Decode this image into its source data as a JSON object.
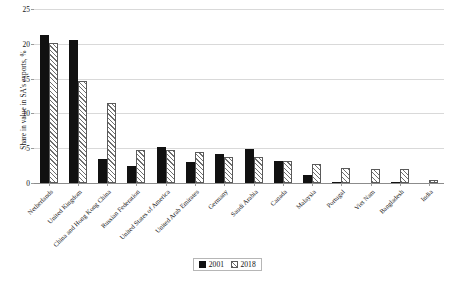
{
  "chart_data": {
    "type": "bar",
    "title": "",
    "xlabel": "",
    "ylabel": "Share in value in SA's exports, %",
    "ylim": [
      0,
      25
    ],
    "yticks": [
      0,
      5,
      10,
      15,
      20,
      25
    ],
    "grid": true,
    "legend_position": "bottom-center",
    "categories": [
      "Netherlands",
      "United Kingdom",
      "China and Hong Kong China",
      "Russian Federation",
      "United States of America",
      "United Arab Emirates",
      "Germany",
      "Saudi Arabia",
      "Canada",
      "Malaysia",
      "Portugal",
      "Viet Nam",
      "Bangladesh",
      "India"
    ],
    "series": [
      {
        "name": "2001",
        "values": [
          21.3,
          20.6,
          3.4,
          2.5,
          5.2,
          3.0,
          4.1,
          4.9,
          3.2,
          1.2,
          0.1,
          0.0,
          0.15,
          0.0
        ]
      },
      {
        "name": "2018",
        "values": [
          20.1,
          14.6,
          11.5,
          4.8,
          4.8,
          4.5,
          3.8,
          3.7,
          3.2,
          2.8,
          2.1,
          2.0,
          2.0,
          0.5
        ]
      }
    ]
  },
  "legend": {
    "items": [
      {
        "label": "2001",
        "pattern": "solid",
        "color": "#111111"
      },
      {
        "label": "2018",
        "pattern": "diagonal-hatch",
        "color": "#6e6e6e"
      }
    ]
  },
  "axis": {
    "y_title": "Share in value in SA's exports, %",
    "y_tick_labels": [
      "0",
      "5",
      "10",
      "15",
      "20",
      "25"
    ]
  },
  "colors": {
    "series_2001": "#111111",
    "series_2018_hatch": "#6e6e6e",
    "gridline": "#d9d9d9",
    "axis": "#8c8c8c",
    "background": "#ffffff"
  }
}
